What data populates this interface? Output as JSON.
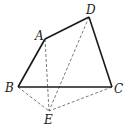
{
  "diagram": {
    "type": "geometry",
    "points": {
      "A": {
        "label": "A",
        "x": 45,
        "y": 39,
        "lx": 35,
        "ly": 40
      },
      "B": {
        "label": "B",
        "x": 18,
        "y": 87,
        "lx": 5,
        "ly": 92
      },
      "C": {
        "label": "C",
        "x": 112,
        "y": 87,
        "lx": 114,
        "ly": 93
      },
      "D": {
        "label": "D",
        "x": 89,
        "y": 17,
        "lx": 86,
        "ly": 14
      },
      "E": {
        "label": "E",
        "x": 49,
        "y": 111,
        "lx": 44,
        "ly": 124
      }
    },
    "solid_segments": [
      [
        "B",
        "A"
      ],
      [
        "A",
        "D"
      ],
      [
        "D",
        "C"
      ],
      [
        "B",
        "C"
      ]
    ],
    "dashed_segments": [
      [
        "A",
        "E"
      ],
      [
        "D",
        "E"
      ],
      [
        "B",
        "E"
      ],
      [
        "C",
        "E"
      ]
    ]
  }
}
